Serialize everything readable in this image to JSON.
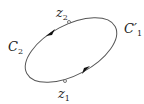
{
  "diagram": {
    "type": "contour",
    "labels": {
      "left_curve": {
        "main": "C",
        "sub": "2"
      },
      "right_curve": {
        "main": "C′",
        "sub": "1"
      },
      "top_point": {
        "main": "z",
        "sub": "2"
      },
      "bottom_point": {
        "main": "z",
        "sub": "1"
      }
    },
    "stroke_color": "#555555",
    "orientation": "counterclockwise"
  }
}
